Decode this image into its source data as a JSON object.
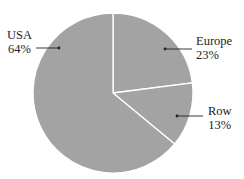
{
  "chart_data": {
    "type": "pie",
    "title": "",
    "slices": [
      {
        "label": "USA",
        "value": 64,
        "display": "64%"
      },
      {
        "label": "Europe",
        "value": 23,
        "display": "23%"
      },
      {
        "label": "Row",
        "value": 13,
        "display": "13%"
      }
    ],
    "start_angle_deg": 0,
    "direction": "clockwise",
    "slice_color": "#a3a3a3",
    "separator_color": "#ffffff",
    "legend": "none",
    "labels": "outside with leader lines"
  },
  "labels": {
    "usa": {
      "name": "USA",
      "pct": "64%"
    },
    "europe": {
      "name": "Europe",
      "pct": "23%"
    },
    "row": {
      "name": "Row",
      "pct": "13%"
    }
  }
}
